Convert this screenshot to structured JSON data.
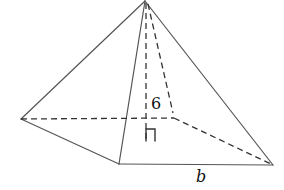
{
  "diagram": {
    "type": "square-pyramid",
    "labels": {
      "height": "6",
      "base_side": "b"
    },
    "vertices": {
      "apex": [
        145,
        1
      ],
      "left": [
        21,
        119
      ],
      "front": [
        119,
        164
      ],
      "right": [
        273,
        165
      ],
      "back": [
        174,
        118
      ],
      "altitude_foot": [
        146,
        118
      ]
    },
    "colors": {
      "edge": "#555555",
      "hidden_edge": "#333333",
      "background": "#ffffff"
    }
  }
}
